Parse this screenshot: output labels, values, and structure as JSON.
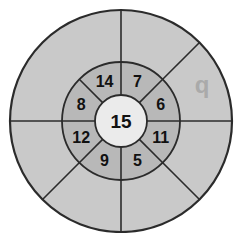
{
  "diagram": {
    "type": "concentric-sector-wheel",
    "center": {
      "x": 121,
      "y": 121
    },
    "colors": {
      "outer_ring_fill": "#c9c9c9",
      "inner_ring_fill": "#b8b8b8",
      "center_fill": "#ebebeb",
      "stroke": "#2b2b2b",
      "label_text": "#111111",
      "watermark_text": "#aaaaaa",
      "background": "#ffffff"
    },
    "radii": {
      "outer": 111,
      "middle": 59,
      "center": 26
    },
    "center_cell": {
      "label": "15",
      "font_size": 19
    },
    "inner_sectors": [
      {
        "id": "sector-n-ne",
        "label": "7",
        "angle_deg": 67.5,
        "label_radius": 43,
        "font_size": 16
      },
      {
        "id": "sector-e-ne",
        "label": "6",
        "angle_deg": 22.5,
        "label_radius": 43,
        "font_size": 16
      },
      {
        "id": "sector-e-se",
        "label": "11",
        "angle_deg": -22.5,
        "label_radius": 43,
        "font_size": 16
      },
      {
        "id": "sector-s-se",
        "label": "5",
        "angle_deg": -67.5,
        "label_radius": 43,
        "font_size": 16
      },
      {
        "id": "sector-s-sw",
        "label": "9",
        "angle_deg": -112.5,
        "label_radius": 43,
        "font_size": 16
      },
      {
        "id": "sector-w-sw",
        "label": "12",
        "angle_deg": -157.5,
        "label_radius": 43,
        "font_size": 16
      },
      {
        "id": "sector-w-nw",
        "label": "8",
        "angle_deg": 157.5,
        "label_radius": 43,
        "font_size": 16
      },
      {
        "id": "sector-n-nw",
        "label": "14",
        "angle_deg": 112.5,
        "label_radius": 43,
        "font_size": 16
      }
    ],
    "inner_divider_angles_deg": [
      0,
      45,
      90,
      135,
      180,
      225,
      270,
      315
    ],
    "outer_divider_angles_deg": [
      0,
      45,
      90,
      180,
      225,
      270,
      315
    ],
    "watermark": {
      "label": "q",
      "x": 202,
      "y": 84,
      "font_size": 24
    }
  }
}
